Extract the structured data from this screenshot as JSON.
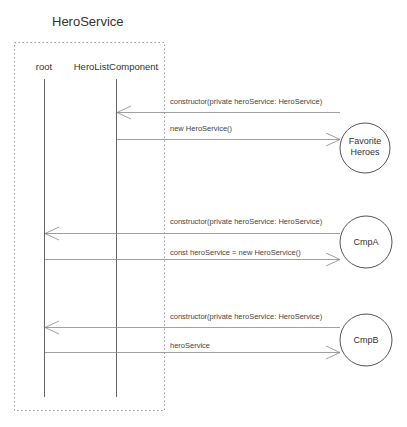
{
  "diagram": {
    "title": "HeroService",
    "lifelines": [
      {
        "label": "root"
      },
      {
        "label": "HeroListComponent"
      }
    ],
    "actors": [
      {
        "label_line1": "Favorite",
        "label_line2": "Heroes"
      },
      {
        "label_line1": "CmpA",
        "label_line2": ""
      },
      {
        "label_line1": "CmpB",
        "label_line2": ""
      }
    ],
    "messages": [
      {
        "label": "constructor(private heroService: HeroService)",
        "from": "Favorite Heroes",
        "to": "HeroListComponent"
      },
      {
        "label": "new HeroService()",
        "from": "HeroListComponent",
        "to": "Favorite Heroes"
      },
      {
        "label": "constructor(private heroService: HeroService)",
        "from": "CmpA",
        "to": "root"
      },
      {
        "label": "const heroService = new HeroService()",
        "from": "root",
        "to": "CmpA"
      },
      {
        "label": "constructor(private heroService: HeroService)",
        "from": "CmpB",
        "to": "root"
      },
      {
        "label": "heroService",
        "from": "root",
        "to": "CmpB"
      }
    ]
  }
}
